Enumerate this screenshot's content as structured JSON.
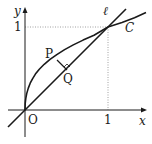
{
  "diagram": {
    "type": "function-graph",
    "axes": {
      "x_label": "x",
      "y_label": "y",
      "origin_label": "O",
      "x_tick_label": "1",
      "y_tick_label": "1"
    },
    "curves": [
      {
        "name": "C",
        "label": "C",
        "equation": "y = sqrt(x)"
      },
      {
        "name": "line",
        "label": "ℓ",
        "equation": "y = x"
      }
    ],
    "points": [
      {
        "name": "P",
        "label": "P",
        "on": "C"
      },
      {
        "name": "Q",
        "label": "Q",
        "on": "ℓ",
        "note": "foot of perpendicular from P"
      }
    ],
    "colors": {
      "stroke": "#1a1a1a",
      "guide": "#888888",
      "background": "#ffffff"
    }
  }
}
